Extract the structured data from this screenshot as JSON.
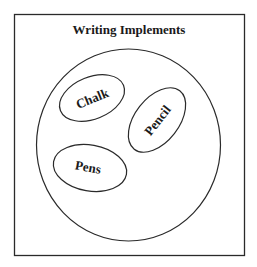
{
  "diagram": {
    "title": "Writing Implements",
    "outer_set": "Writing Implements",
    "subsets": [
      {
        "label": "Chalk"
      },
      {
        "label": "Pencil"
      },
      {
        "label": "Pens"
      }
    ],
    "colors": {
      "stroke": "#2a2a2a",
      "background": "#ffffff",
      "text": "#1a1a1a"
    }
  }
}
